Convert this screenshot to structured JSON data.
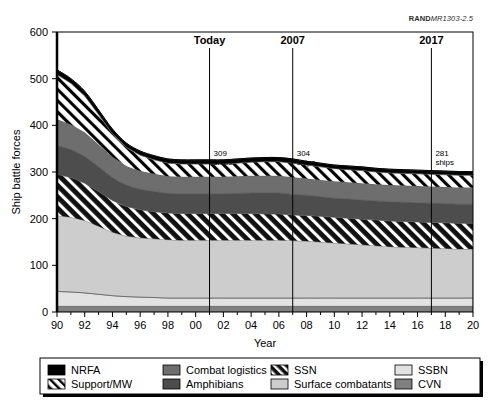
{
  "source_label": {
    "bold": "RAND",
    "italic": "MR1303-2.5"
  },
  "chart_data": {
    "type": "area",
    "title": "",
    "xlabel": "Year",
    "ylabel": "Ship battle forces",
    "xlim": [
      90,
      120
    ],
    "ylim": [
      0,
      600
    ],
    "grid": false,
    "legend_position": "bottom",
    "stacked": true,
    "x": [
      90,
      91,
      92,
      93,
      94,
      95,
      96,
      97,
      98,
      99,
      100,
      101,
      102,
      103,
      104,
      105,
      106,
      107,
      108,
      109,
      110,
      111,
      112,
      113,
      114,
      115,
      116,
      117,
      118,
      119,
      120
    ],
    "x_tick_labels": [
      "90",
      "92",
      "94",
      "96",
      "98",
      "00",
      "02",
      "04",
      "06",
      "08",
      "10",
      "12",
      "14",
      "16",
      "18",
      "20"
    ],
    "x_tick_values": [
      90,
      92,
      94,
      96,
      98,
      100,
      102,
      104,
      106,
      108,
      110,
      112,
      114,
      116,
      118,
      120
    ],
    "y_tick_values": [
      0,
      100,
      200,
      300,
      400,
      500,
      600
    ],
    "y_tick_labels": [
      "0",
      "100",
      "200",
      "300",
      "400",
      "500",
      "600"
    ],
    "series": [
      {
        "name": "CVN",
        "fill": "#808080",
        "pattern": "solid",
        "values": [
          12,
          12,
          12,
          12,
          12,
          12,
          12,
          12,
          12,
          12,
          12,
          12,
          12,
          12,
          12,
          12,
          12,
          12,
          12,
          12,
          12,
          12,
          12,
          12,
          12,
          12,
          12,
          12,
          12,
          12,
          12
        ]
      },
      {
        "name": "SSBN",
        "fill": "#e2e2e2",
        "pattern": "solid",
        "values": [
          32,
          31,
          29,
          26,
          23,
          21,
          20,
          19,
          18,
          18,
          18,
          18,
          18,
          18,
          18,
          18,
          18,
          18,
          18,
          18,
          18,
          18,
          18,
          18,
          18,
          18,
          18,
          18,
          18,
          18,
          18
        ]
      },
      {
        "name": "Surface combatants",
        "fill": "#cdcdcd",
        "pattern": "solid",
        "values": [
          163,
          160,
          155,
          146,
          136,
          130,
          127,
          126,
          125,
          124,
          124,
          124,
          124,
          124,
          124,
          124,
          124,
          123,
          122,
          120,
          118,
          116,
          114,
          112,
          110,
          109,
          108,
          107,
          106,
          105,
          105
        ]
      },
      {
        "name": "SSN",
        "fill": "#111111",
        "pattern": "hatch-white",
        "values": [
          88,
          85,
          80,
          74,
          68,
          63,
          60,
          58,
          57,
          57,
          57,
          57,
          57,
          57,
          57,
          56,
          56,
          55,
          55,
          55,
          55,
          55,
          55,
          55,
          55,
          55,
          55,
          55,
          55,
          55,
          55
        ]
      },
      {
        "name": "Amphibians",
        "fill": "#4d4d4d",
        "pattern": "solid",
        "values": [
          62,
          60,
          57,
          53,
          49,
          46,
          44,
          43,
          42,
          42,
          42,
          42,
          42,
          43,
          44,
          45,
          45,
          44,
          43,
          42,
          41,
          41,
          41,
          41,
          41,
          41,
          41,
          41,
          41,
          41,
          41
        ]
      },
      {
        "name": "Combat logistics",
        "fill": "#6e6e6e",
        "pattern": "solid",
        "values": [
          56,
          54,
          52,
          48,
          44,
          41,
          39,
          38,
          37,
          37,
          37,
          37,
          37,
          37,
          37,
          37,
          37,
          37,
          36,
          36,
          36,
          36,
          36,
          36,
          36,
          36,
          36,
          36,
          36,
          36,
          36
        ]
      },
      {
        "name": "Support/MW",
        "fill": "#ffffff",
        "pattern": "hatch-black",
        "values": [
          96,
          88,
          78,
          64,
          50,
          40,
          34,
          30,
          28,
          27,
          27,
          27,
          27,
          28,
          29,
          30,
          30,
          30,
          29,
          28,
          27,
          27,
          27,
          26,
          26,
          26,
          26,
          26,
          26,
          26,
          26
        ]
      },
      {
        "name": "NRFA",
        "fill": "#000000",
        "pattern": "solid",
        "values": [
          10,
          10,
          10,
          10,
          10,
          9,
          9,
          9,
          9,
          9,
          9,
          9,
          9,
          9,
          9,
          9,
          9,
          9,
          8,
          8,
          8,
          8,
          8,
          8,
          8,
          8,
          8,
          8,
          8,
          8,
          8
        ]
      }
    ],
    "markers": [
      {
        "label": "Today",
        "x": 101,
        "annotation": "309\nships",
        "annotation_line1": "309",
        "annotation_line2": "ships"
      },
      {
        "label": "2007",
        "x": 107,
        "annotation": "304\nships",
        "annotation_line1": "304",
        "annotation_line2": "ships"
      },
      {
        "label": "2017",
        "x": 117,
        "annotation": "281\nships",
        "annotation_line1": "281",
        "annotation_line2": "ships"
      }
    ],
    "legend": [
      {
        "label": "NRFA",
        "fill": "#000000",
        "pattern": "solid",
        "col": 0,
        "row": 0
      },
      {
        "label": "Support/MW",
        "fill": "#ffffff",
        "pattern": "hatch-black",
        "col": 0,
        "row": 1
      },
      {
        "label": "Combat logistics",
        "fill": "#6e6e6e",
        "pattern": "solid",
        "col": 1,
        "row": 0
      },
      {
        "label": "Amphibians",
        "fill": "#4d4d4d",
        "pattern": "solid",
        "col": 1,
        "row": 1
      },
      {
        "label": "SSN",
        "fill": "#111111",
        "pattern": "hatch-white",
        "col": 2,
        "row": 0
      },
      {
        "label": "Surface combatants",
        "fill": "#cdcdcd",
        "pattern": "solid",
        "col": 2,
        "row": 1
      },
      {
        "label": "SSBN",
        "fill": "#e2e2e2",
        "pattern": "solid",
        "col": 3,
        "row": 0
      },
      {
        "label": "CVN",
        "fill": "#808080",
        "pattern": "solid",
        "col": 3,
        "row": 1
      }
    ]
  }
}
